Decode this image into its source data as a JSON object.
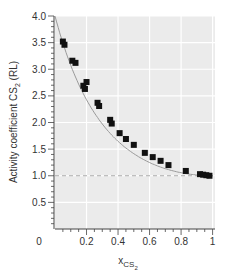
{
  "chart_data": {
    "type": "scatter",
    "title": "",
    "xlabel": "x_CS2",
    "xlabel_main": "x",
    "xlabel_sub": "CS",
    "xlabel_subsub": "2",
    "ylabel": "Activity coefficient CS2 (RL)",
    "ylabel_pre": "Activity coefficient CS",
    "ylabel_sub": "2",
    "ylabel_post": " (RL)",
    "xlim": [
      0,
      1.0
    ],
    "ylim": [
      0,
      4.0
    ],
    "x_ticks": [
      0,
      0.2,
      0.4,
      0.6,
      0.8,
      1
    ],
    "x_tick_labels": [
      "0",
      "0.2",
      "0.4",
      "0.6",
      "0.8",
      "1"
    ],
    "y_ticks": [
      0.5,
      1.0,
      1.5,
      2.0,
      2.5,
      3.0,
      3.5,
      4.0
    ],
    "y_tick_labels": [
      "0.5",
      "1.0",
      "1.5",
      "2.0",
      "2.5",
      "3.0",
      "3.5",
      "4.0"
    ],
    "grid": true,
    "reference_line": {
      "y": 1.0,
      "style": "dashed"
    },
    "series": [
      {
        "name": "measured",
        "marker": "square",
        "points": [
          [
            0.05,
            3.52
          ],
          [
            0.06,
            3.46
          ],
          [
            0.11,
            3.16
          ],
          [
            0.13,
            3.12
          ],
          [
            0.18,
            2.69
          ],
          [
            0.2,
            2.76
          ],
          [
            0.19,
            2.63
          ],
          [
            0.27,
            2.37
          ],
          [
            0.28,
            2.31
          ],
          [
            0.35,
            2.05
          ],
          [
            0.36,
            1.98
          ],
          [
            0.41,
            1.8
          ],
          [
            0.45,
            1.69
          ],
          [
            0.5,
            1.58
          ],
          [
            0.57,
            1.43
          ],
          [
            0.62,
            1.35
          ],
          [
            0.67,
            1.28
          ],
          [
            0.72,
            1.2
          ],
          [
            0.83,
            1.09
          ],
          [
            0.92,
            1.03
          ],
          [
            0.94,
            1.02
          ],
          [
            0.96,
            1.01
          ],
          [
            0.98,
            1.0
          ]
        ]
      },
      {
        "name": "fit",
        "type": "line",
        "function": "exp(1.386*(1-x)^2)",
        "color": "#999999"
      }
    ]
  },
  "colors": {
    "plot_bg": "#ebebeb",
    "grid": "#ffffff",
    "marker": "#111111",
    "fit_line": "#9a9a9a",
    "ref_line": "#aaaaaa",
    "axis": "#444444"
  }
}
